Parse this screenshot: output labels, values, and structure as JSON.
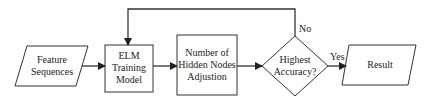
{
  "diagram": {
    "type": "flowchart",
    "nodes": [
      {
        "id": "feature",
        "shape": "parallelogram",
        "lines": [
          "Feature",
          "Sequences"
        ]
      },
      {
        "id": "elm",
        "shape": "rectangle",
        "lines": [
          "ELM",
          "Training",
          "Model"
        ]
      },
      {
        "id": "hidden",
        "shape": "rectangle",
        "lines": [
          "Number of",
          "Hidden Nodes",
          "Adjustion"
        ]
      },
      {
        "id": "decision",
        "shape": "diamond",
        "lines": [
          "Highest",
          "Accuracy?"
        ]
      },
      {
        "id": "result",
        "shape": "parallelogram",
        "lines": [
          "Result"
        ]
      }
    ],
    "edges": [
      {
        "from": "feature",
        "to": "elm",
        "label": ""
      },
      {
        "from": "elm",
        "to": "hidden",
        "label": ""
      },
      {
        "from": "hidden",
        "to": "decision",
        "label": ""
      },
      {
        "from": "decision",
        "to": "result",
        "label": "Yes"
      },
      {
        "from": "decision",
        "to": "elm",
        "label": "No"
      }
    ],
    "edge_labels": {
      "yes": "Yes",
      "no": "No"
    },
    "colors": {
      "stroke": "#333333",
      "fill": "#ffffff",
      "text": "#222222"
    }
  }
}
